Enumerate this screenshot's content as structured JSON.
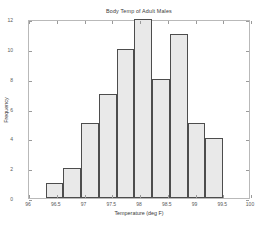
{
  "chart_data": {
    "type": "bar",
    "title": "Body Temp of Adult Males",
    "xlabel": "Temperature (deg F)",
    "ylabel": "Frequency",
    "xlim": [
      96,
      100
    ],
    "ylim": [
      0,
      12
    ],
    "grid": false,
    "legend": null,
    "xticks": [
      "96",
      "96.5",
      "97",
      "97.5",
      "98",
      "98.5",
      "99",
      "99.5",
      "100"
    ],
    "xtick_values": [
      96,
      96.5,
      97,
      97.5,
      98,
      98.5,
      99,
      99.5,
      100
    ],
    "yticks": [
      "0",
      "2",
      "4",
      "6",
      "8",
      "10",
      "12"
    ],
    "ytick_values": [
      0,
      2,
      4,
      6,
      8,
      10,
      12
    ],
    "bin_width": 0.32,
    "bin_starts": [
      96.3,
      96.62,
      96.94,
      97.26,
      97.58,
      97.9,
      98.22,
      98.54,
      98.86,
      99.18
    ],
    "categories": [
      "96.3-96.6",
      "96.6-96.9",
      "96.9-97.3",
      "97.3-97.6",
      "97.6-97.9",
      "97.9-98.2",
      "98.2-98.5",
      "98.5-98.9",
      "98.9-99.2",
      "99.2-99.5"
    ],
    "values": [
      1,
      2,
      5,
      7,
      10,
      12,
      8,
      11,
      5,
      4
    ],
    "bar_fill_color": "#e9e9e9",
    "bar_edge_color": "#4d4d4d",
    "axis_color": "#b9b9b9",
    "background_color": "#ffffff"
  }
}
